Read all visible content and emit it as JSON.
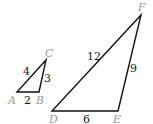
{
  "diagram": {
    "triangles": [
      {
        "name": "ABC",
        "vertices": {
          "A": {
            "label": "A",
            "x": 17,
            "y": 92,
            "lx": 8,
            "ly": 104
          },
          "B": {
            "label": "B",
            "x": 39,
            "y": 92,
            "lx": 36,
            "ly": 104
          },
          "C": {
            "label": "C",
            "x": 46,
            "y": 60,
            "lx": 45,
            "ly": 57
          }
        },
        "sides": {
          "AC": {
            "label": "4",
            "lx": 23,
            "ly": 75
          },
          "BC": {
            "label": "3",
            "lx": 44,
            "ly": 82
          },
          "AB": {
            "label": "2",
            "lx": 24,
            "ly": 104
          }
        }
      },
      {
        "name": "DEF",
        "vertices": {
          "D": {
            "label": "D",
            "x": 52,
            "y": 111,
            "lx": 49,
            "ly": 123
          },
          "E": {
            "label": "E",
            "x": 118,
            "y": 111,
            "lx": 113,
            "ly": 123
          },
          "F": {
            "label": "F",
            "x": 141,
            "y": 15,
            "lx": 138,
            "ly": 11
          }
        },
        "sides": {
          "DF": {
            "label": "12",
            "lx": 87,
            "ly": 60
          },
          "EF": {
            "label": "9",
            "lx": 130,
            "ly": 72
          },
          "DE": {
            "label": "6",
            "lx": 83,
            "ly": 123
          }
        }
      }
    ]
  }
}
